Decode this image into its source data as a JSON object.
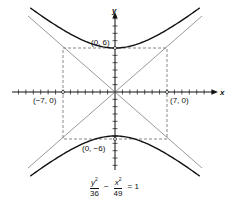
{
  "diagram": {
    "type": "hyperbola",
    "equation": {
      "term1_num_var": "y",
      "term1_num_exp": "2",
      "term1_den": "36",
      "operator": "−",
      "term2_num_var": "x",
      "term2_num_exp": "2",
      "term2_den": "49",
      "rhs": "= 1"
    },
    "axes": {
      "x_label": "x",
      "y_label": "y"
    },
    "points": [
      {
        "label": "(0, 6)",
        "x": 0,
        "y": 6
      },
      {
        "label": "(0, −6)",
        "x": 0,
        "y": -6
      },
      {
        "label": "(−7, 0)",
        "x": -7,
        "y": 0
      },
      {
        "label": "(7, 0)",
        "x": 7,
        "y": 0
      }
    ],
    "a": 6,
    "b": 7,
    "asymptotes": [
      "y = 6/7 x",
      "y = -6/7 x"
    ],
    "colors": {
      "curve": "#111111",
      "guide": "#555555",
      "background": "#ffffff"
    }
  }
}
